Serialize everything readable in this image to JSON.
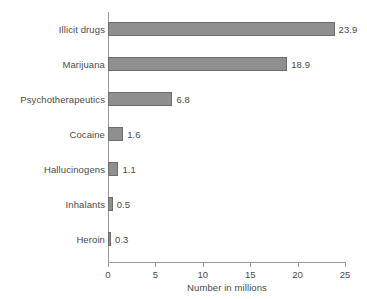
{
  "chart_data": {
    "type": "bar",
    "orientation": "horizontal",
    "title": "",
    "xlabel": "Number in millions",
    "ylabel": "",
    "categories": [
      "Illicit drugs",
      "Marijuana",
      "Psychotherapeutics",
      "Cocaine",
      "Hallucinogens",
      "Inhalants",
      "Heroin"
    ],
    "values": [
      23.9,
      18.9,
      6.8,
      1.6,
      1.1,
      0.5,
      0.3
    ],
    "value_labels": [
      "23.9",
      "18.9",
      "6.8",
      "1.6",
      "1.1",
      "0.5",
      "0.3"
    ],
    "xlim": [
      0,
      25
    ],
    "xticks": [
      0,
      5,
      10,
      15,
      20,
      25
    ],
    "xtick_labels": [
      "0",
      "5",
      "10",
      "15",
      "20",
      "25"
    ],
    "grid": false,
    "legend": false,
    "colors": {
      "bar_fill": "#8f8f8f",
      "bar_stroke": "#6d6d6d",
      "axis": "#9a9a9a",
      "text": "#4a4a4a",
      "background": "#ffffff"
    }
  }
}
